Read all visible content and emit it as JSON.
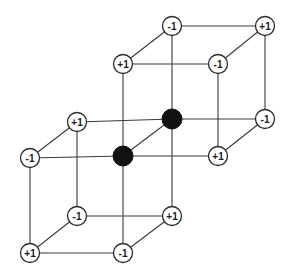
{
  "diagram": {
    "title": "",
    "colors": {
      "edge": "#3a3a3a",
      "node_fill": "#ffffff",
      "filled_node": "#111111"
    },
    "nodes": [
      {
        "id": "u_btl",
        "x": 172,
        "y": 26,
        "label": "-1",
        "type": "open"
      },
      {
        "id": "u_btr",
        "x": 265,
        "y": 26,
        "label": "+1",
        "type": "open"
      },
      {
        "id": "u_ftl",
        "x": 123,
        "y": 64,
        "label": "+1",
        "type": "open"
      },
      {
        "id": "u_ftr",
        "x": 218,
        "y": 64,
        "label": "-1",
        "type": "open"
      },
      {
        "id": "u_bbr",
        "x": 265,
        "y": 119,
        "label": "-1",
        "type": "open"
      },
      {
        "id": "c_b",
        "x": 172,
        "y": 119,
        "label": "",
        "type": "filled"
      },
      {
        "id": "u_fbr",
        "x": 218,
        "y": 156,
        "label": "+1",
        "type": "open"
      },
      {
        "id": "c_f",
        "x": 123,
        "y": 156,
        "label": "",
        "type": "filled"
      },
      {
        "id": "l_btl",
        "x": 77,
        "y": 122,
        "label": "+1",
        "type": "open"
      },
      {
        "id": "l_ftl",
        "x": 30,
        "y": 158,
        "label": "-1",
        "type": "open"
      },
      {
        "id": "l_bbl",
        "x": 77,
        "y": 216,
        "label": "-1",
        "type": "open"
      },
      {
        "id": "l_bbr",
        "x": 172,
        "y": 216,
        "label": "+1",
        "type": "open"
      },
      {
        "id": "l_fbl",
        "x": 30,
        "y": 253,
        "label": "+1",
        "type": "open"
      },
      {
        "id": "l_fbr",
        "x": 123,
        "y": 253,
        "label": "-1",
        "type": "open"
      }
    ],
    "edges": [
      [
        "u_btl",
        "u_btr"
      ],
      [
        "u_ftl",
        "u_ftr"
      ],
      [
        "u_btl",
        "u_ftl"
      ],
      [
        "u_btr",
        "u_ftr"
      ],
      [
        "u_btl",
        "c_b"
      ],
      [
        "u_btr",
        "u_bbr"
      ],
      [
        "u_ftl",
        "c_f"
      ],
      [
        "u_ftr",
        "u_fbr"
      ],
      [
        "c_b",
        "u_bbr"
      ],
      [
        "c_f",
        "u_fbr"
      ],
      [
        "c_b",
        "c_f"
      ],
      [
        "u_bbr",
        "u_fbr"
      ],
      [
        "l_btl",
        "c_b"
      ],
      [
        "l_ftl",
        "c_f"
      ],
      [
        "l_btl",
        "l_ftl"
      ],
      [
        "l_btl",
        "l_bbl"
      ],
      [
        "l_ftl",
        "l_fbl"
      ],
      [
        "c_b",
        "l_bbr"
      ],
      [
        "c_f",
        "l_fbr"
      ],
      [
        "l_bbl",
        "l_bbr"
      ],
      [
        "l_fbl",
        "l_fbr"
      ],
      [
        "l_bbl",
        "l_fbl"
      ],
      [
        "l_bbr",
        "l_fbr"
      ]
    ]
  }
}
